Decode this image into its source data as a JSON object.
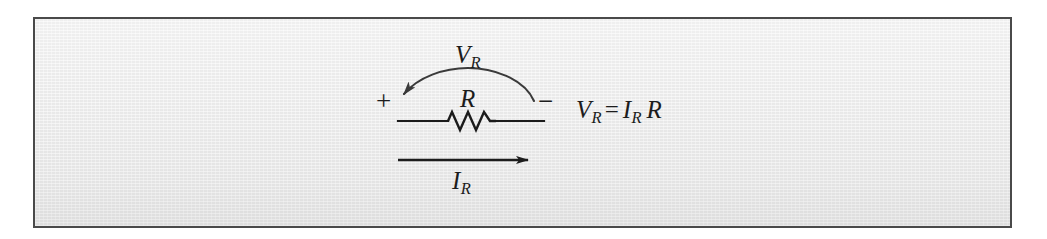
{
  "figure": {
    "panel": {
      "border_color": "#4a4a4a",
      "background_color": "#e9e9e9",
      "ink_color": "#1c1c1c"
    },
    "labels": {
      "voltage_arc": {
        "symbol": "V",
        "subscript": "R"
      },
      "resistor": {
        "symbol": "R"
      },
      "current_arrow": {
        "symbol": "I",
        "subscript": "R"
      },
      "polarity_plus": "+",
      "polarity_minus": "−"
    },
    "equation": {
      "lhs_symbol": "V",
      "lhs_subscript": "R",
      "relation": "=",
      "rhs_first_symbol": "I",
      "rhs_first_subscript": "R",
      "rhs_second_symbol": "R",
      "plain_text": "V_R = I_R R"
    },
    "elements": {
      "voltage_arc_name": "voltage-arc-arrow",
      "current_arrow_name": "current-arrow",
      "resistor_symbol_name": "resistor-zigzag",
      "wire_name": "circuit-wire"
    }
  }
}
